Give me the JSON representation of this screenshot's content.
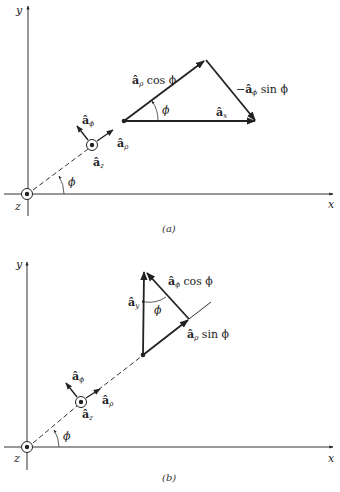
{
  "figure": {
    "panels": [
      {
        "id": "a",
        "caption": "(a)",
        "axes": {
          "x_label": "x",
          "y_label": "y",
          "z_label": "z"
        },
        "angle_label": "ϕ",
        "unit_vectors": {
          "a_phi": {
            "base": "â",
            "sub": "ϕ"
          },
          "a_rho": {
            "base": "â",
            "sub": "ρ"
          },
          "a_z": {
            "base": "â",
            "sub": "z"
          }
        },
        "triangle": {
          "side1": {
            "base": "â",
            "sub": "ρ",
            "suffix": " cos ϕ"
          },
          "side2": {
            "prefix": "−",
            "base": "â",
            "sub": "ϕ",
            "suffix": " sin ϕ"
          },
          "resultant": {
            "base": "â",
            "sub": "x"
          },
          "angle": "ϕ"
        }
      },
      {
        "id": "b",
        "caption": "(b)",
        "axes": {
          "x_label": "x",
          "y_label": "y",
          "z_label": "z"
        },
        "angle_label": "ϕ",
        "unit_vectors": {
          "a_phi": {
            "base": "â",
            "sub": "ϕ"
          },
          "a_rho": {
            "base": "â",
            "sub": "ρ"
          },
          "a_z": {
            "base": "â",
            "sub": "z"
          }
        },
        "triangle": {
          "side1": {
            "base": "â",
            "sub": "ρ",
            "suffix": " sin ϕ"
          },
          "side2": {
            "base": "â",
            "sub": "ϕ",
            "suffix": " cos ϕ"
          },
          "resultant": {
            "base": "â",
            "sub": "y"
          },
          "angle": "ϕ"
        }
      }
    ]
  }
}
